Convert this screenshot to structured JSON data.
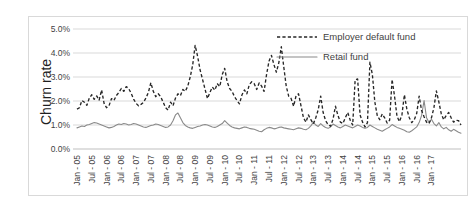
{
  "chart_data": {
    "type": "line",
    "title": "",
    "xlabel": "",
    "ylabel": "Churn rate",
    "ylim": [
      0,
      5
    ],
    "ytick_labels": [
      "0.0%",
      "1.0%",
      "2.0%",
      "3.0%",
      "4.0%",
      "5.0%"
    ],
    "ytick_values": [
      0,
      1,
      2,
      3,
      4,
      5
    ],
    "grid": true,
    "legend_position": "top-right",
    "legend": [
      "Employer default fund",
      "Retail fund"
    ],
    "x_tick_labels": [
      "Jan - 05",
      "Jul - 05",
      "Jan - 06",
      "Jul - 06",
      "Jan - 07",
      "Jul - 07",
      "Jan - 08",
      "Jul - 08",
      "Jan - 09",
      "Jul - 09",
      "Jan - 10",
      "Jul - 10",
      "Jan - 11",
      "Jul - 11",
      "Jan - 12",
      "Jul - 12",
      "Jan - 13",
      "Jul - 13",
      "Jan - 14",
      "Jul - 14",
      "Jan - 15",
      "Jul - 15",
      "Jan - 16",
      "Jul - 16",
      "Jan - 17"
    ],
    "x_tick_interval_months": 6,
    "x_start": "Jan 2005",
    "x_end": "Jan 2017",
    "n_points": 145,
    "series": [
      {
        "name": "Employer default fund",
        "style": "dashed",
        "color": "#262626",
        "values": [
          1.66,
          1.72,
          2.02,
          1.95,
          1.82,
          2.12,
          2.26,
          2.07,
          2.21,
          2.04,
          2.46,
          1.9,
          1.72,
          1.8,
          2.1,
          2.02,
          2.23,
          2.35,
          2.52,
          2.4,
          2.6,
          2.52,
          2.32,
          2.08,
          1.9,
          1.8,
          1.86,
          1.94,
          2.12,
          2.36,
          2.76,
          2.4,
          2.18,
          2.3,
          2.18,
          1.95,
          1.72,
          1.62,
          1.95,
          1.8,
          2.12,
          2.3,
          2.22,
          2.48,
          2.4,
          2.62,
          3.0,
          3.5,
          4.32,
          3.86,
          3.3,
          2.9,
          2.5,
          2.1,
          2.36,
          2.58,
          2.45,
          2.72,
          2.6,
          3.1,
          3.36,
          2.8,
          2.52,
          2.4,
          2.18,
          2.02,
          1.88,
          2.25,
          2.46,
          2.3,
          2.68,
          2.8,
          2.72,
          2.48,
          2.75,
          2.62,
          2.4,
          3.1,
          3.66,
          3.9,
          3.52,
          3.2,
          3.6,
          4.26,
          3.42,
          2.62,
          2.2,
          2.1,
          1.78,
          2.22,
          2.3,
          1.8,
          1.3,
          1.12,
          1.42,
          1.22,
          1.05,
          1.3,
          1.64,
          2.2,
          1.52,
          1.18,
          1.02,
          0.95,
          1.24,
          1.78,
          1.4,
          1.12,
          1.06,
          1.3,
          1.52,
          1.2,
          1.0,
          2.88,
          2.92,
          1.42,
          1.12,
          0.92,
          1.1,
          3.62,
          3.1,
          1.95,
          1.38,
          1.22,
          1.46,
          1.3,
          1.08,
          1.2,
          2.9,
          2.2,
          1.36,
          1.14,
          1.42,
          2.26,
          1.66,
          1.3,
          1.1,
          1.22,
          1.48,
          2.2,
          1.6,
          1.34,
          1.12,
          1.06,
          1.3,
          1.72,
          2.42,
          1.96,
          1.46,
          1.22,
          1.4,
          1.52,
          1.3,
          1.12,
          1.2,
          1.18,
          1.0
        ]
      },
      {
        "name": "Retail fund",
        "style": "solid",
        "color": "#8a8a8a",
        "values": [
          0.88,
          0.92,
          0.96,
          0.94,
          1.0,
          1.02,
          1.06,
          1.1,
          1.08,
          1.04,
          1.0,
          0.96,
          0.92,
          0.88,
          0.9,
          0.94,
          1.0,
          1.04,
          1.02,
          1.06,
          1.04,
          1.0,
          1.02,
          1.06,
          1.04,
          1.0,
          0.96,
          0.92,
          0.9,
          0.94,
          0.98,
          1.0,
          1.04,
          1.02,
          0.98,
          0.94,
          0.9,
          0.92,
          1.0,
          1.18,
          1.42,
          1.5,
          1.3,
          1.1,
          0.98,
          0.92,
          0.88,
          0.86,
          0.9,
          0.94,
          0.96,
          1.0,
          1.02,
          1.0,
          0.96,
          0.92,
          0.9,
          0.94,
          1.0,
          1.06,
          1.18,
          1.08,
          0.98,
          0.92,
          0.88,
          0.86,
          0.84,
          0.88,
          0.92,
          0.9,
          0.86,
          0.84,
          0.82,
          0.78,
          0.74,
          0.72,
          0.8,
          0.86,
          0.9,
          0.88,
          0.84,
          0.86,
          0.9,
          0.92,
          0.88,
          0.86,
          0.84,
          0.82,
          0.8,
          0.84,
          0.88,
          0.86,
          0.82,
          0.8,
          0.86,
          0.96,
          1.12,
          1.0,
          0.94,
          1.06,
          0.96,
          0.9,
          0.86,
          0.92,
          1.04,
          0.98,
          0.92,
          0.88,
          0.94,
          1.0,
          0.96,
          0.92,
          0.88,
          0.94,
          1.0,
          0.96,
          0.9,
          0.86,
          0.9,
          1.0,
          0.94,
          0.88,
          0.82,
          0.78,
          0.74,
          0.8,
          0.86,
          0.92,
          1.02,
          0.96,
          0.9,
          0.86,
          0.82,
          0.78,
          0.72,
          0.7,
          0.76,
          0.84,
          0.92,
          1.1,
          1.4,
          2.02,
          1.3,
          1.1,
          1.24,
          1.06,
          0.96,
          1.1,
          0.92,
          0.84,
          0.9,
          0.8,
          0.74,
          0.82,
          0.76,
          0.7,
          0.66
        ]
      }
    ]
  }
}
